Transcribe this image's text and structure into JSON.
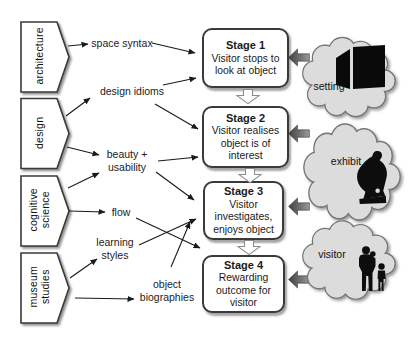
{
  "figure": {
    "disciplines": [
      {
        "label": "architecture"
      },
      {
        "label": "design"
      },
      {
        "label": "cognitive\nscience"
      },
      {
        "label": "museum\nstudies"
      }
    ],
    "concepts": [
      {
        "label": "space syntax"
      },
      {
        "label": "design idioms"
      },
      {
        "label": "beauty +\nusability"
      },
      {
        "label": "flow"
      },
      {
        "label": "learning\nstyles"
      },
      {
        "label": "object\nbiographies"
      }
    ],
    "stages": [
      {
        "title": "Stage 1",
        "body": "Visitor stops to\nlook at object"
      },
      {
        "title": "Stage 2",
        "body": "Visitor realises\nobject is of\ninterest"
      },
      {
        "title": "Stage 3",
        "body": "Visitor\ninvestigates,\nenjoys object"
      },
      {
        "title": "Stage 4",
        "body": "Rewarding\noutcome for\nvisitor"
      }
    ],
    "contexts": [
      {
        "label": "setting",
        "icon": "cube-icon"
      },
      {
        "label": "exhibit",
        "icon": "statue-icon"
      },
      {
        "label": "visitor",
        "icon": "family-icon"
      }
    ],
    "colors": {
      "cloud_fill": "#dcdcdc",
      "cloud_outline": "#767676",
      "box_border": "#3a3a3a",
      "thin_arrow": "#1a1a1a",
      "block_arrow_dark": "#3f3f3f",
      "block_arrow_light": "#9a9a9a"
    }
  }
}
